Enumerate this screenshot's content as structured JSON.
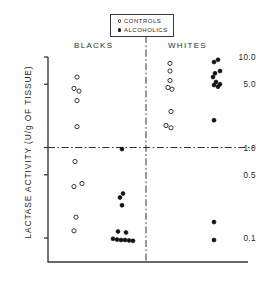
{
  "figure": {
    "kind": "scatter-dot-plot",
    "axis": {
      "x_left_px": 48,
      "x_right_px": 248,
      "y_top_px": 57,
      "y_bottom_px": 262
    },
    "colors": {
      "axis": "#3a3a3a",
      "marker_open_stroke": "#2b2b2b",
      "marker_filled": "#111111",
      "reference_line": "#333333",
      "text": "#1f1f1f",
      "background": "#ffffff"
    }
  },
  "legend": {
    "position": "top-center",
    "entries": [
      {
        "marker": "open-circle",
        "label": "CONTROLS"
      },
      {
        "marker": "filled-circle",
        "label": "ALCOHOLICS"
      }
    ]
  },
  "groups": {
    "left_label": "BLACKS",
    "right_label": "WHITES"
  },
  "chart_data": {
    "type": "scatter",
    "title": "",
    "subtitle": "",
    "xlabel": "",
    "ylabel": "LACTASE ACTIVITY (U/g OF TISSUE)",
    "yscale": "log",
    "ylim": [
      0.07,
      11.5
    ],
    "yticks": [
      10.0,
      5.0,
      1.0,
      0.5,
      0.1
    ],
    "ytick_labels": [
      "10.0",
      "5.0",
      "1.0",
      "0.5",
      "0.1"
    ],
    "grid": false,
    "legend_position": "top-center",
    "xcategories": [
      "BLACKS / CONTROLS",
      "BLACKS / ALCOHOLICS",
      "WHITES / CONTROLS",
      "WHITES / ALCOHOLICS"
    ],
    "annotations": [
      {
        "type": "hline",
        "y": 1.0,
        "style": "dash-dot",
        "label": "1.0 reference"
      },
      {
        "type": "vline",
        "x": "between BLACKS and WHITES",
        "style": "dash-dot",
        "label": "group divider"
      }
    ],
    "series": [
      {
        "name": "BLACKS / CONTROLS",
        "marker": "open-circle",
        "group": "BLACKS",
        "subject": "CONTROLS",
        "column_x_px": 77,
        "n": 9,
        "values": [
          6.0,
          4.5,
          4.2,
          3.3,
          1.7,
          0.7,
          0.4,
          0.37,
          0.17,
          0.12
        ],
        "points": [
          {
            "y": 6.0,
            "dx": 0
          },
          {
            "y": 4.5,
            "dx": -3
          },
          {
            "y": 4.2,
            "dx": 2
          },
          {
            "y": 3.3,
            "dx": 0
          },
          {
            "y": 1.7,
            "dx": 0
          },
          {
            "y": 0.7,
            "dx": -2
          },
          {
            "y": 0.4,
            "dx": 5
          },
          {
            "y": 0.37,
            "dx": -3
          },
          {
            "y": 0.17,
            "dx": -1
          },
          {
            "y": 0.12,
            "dx": -3
          }
        ]
      },
      {
        "name": "BLACKS / ALCOHOLICS",
        "marker": "filled-circle",
        "group": "BLACKS",
        "subject": "ALCOHOLICS",
        "column_x_px": 122,
        "n": 12,
        "values": [
          0.96,
          0.31,
          0.28,
          0.23,
          0.118,
          0.115,
          0.098,
          0.096,
          0.095,
          0.095,
          0.094,
          0.093
        ],
        "points": [
          {
            "y": 0.96,
            "dx": 0
          },
          {
            "y": 0.31,
            "dx": 1
          },
          {
            "y": 0.28,
            "dx": -2
          },
          {
            "y": 0.23,
            "dx": 0
          },
          {
            "y": 0.118,
            "dx": -4
          },
          {
            "y": 0.115,
            "dx": 4
          },
          {
            "y": 0.098,
            "dx": -9
          },
          {
            "y": 0.096,
            "dx": -5
          },
          {
            "y": 0.095,
            "dx": -1
          },
          {
            "y": 0.095,
            "dx": 3
          },
          {
            "y": 0.094,
            "dx": 7
          },
          {
            "y": 0.093,
            "dx": 11
          }
        ]
      },
      {
        "name": "WHITES / CONTROLS",
        "marker": "open-circle",
        "group": "WHITES",
        "subject": "CONTROLS",
        "column_x_px": 170,
        "n": 8,
        "values": [
          8.5,
          7.0,
          5.5,
          4.6,
          4.4,
          2.5,
          1.75,
          1.65
        ],
        "points": [
          {
            "y": 8.5,
            "dx": 0
          },
          {
            "y": 7.0,
            "dx": 0
          },
          {
            "y": 5.5,
            "dx": 0
          },
          {
            "y": 4.6,
            "dx": -2
          },
          {
            "y": 4.4,
            "dx": 2
          },
          {
            "y": 2.5,
            "dx": 1
          },
          {
            "y": 1.75,
            "dx": -4
          },
          {
            "y": 1.65,
            "dx": 1
          }
        ]
      },
      {
        "name": "WHITES / ALCOHOLICS",
        "marker": "filled-circle",
        "group": "WHITES",
        "subject": "ALCOHOLICS",
        "column_x_px": 216,
        "n": 12,
        "values": [
          9.3,
          8.8,
          7.0,
          6.6,
          6.0,
          5.3,
          5.0,
          4.9,
          4.7,
          2.0,
          0.15,
          0.095
        ],
        "points": [
          {
            "y": 9.3,
            "dx": 2
          },
          {
            "y": 8.8,
            "dx": -2
          },
          {
            "y": 7.0,
            "dx": 4
          },
          {
            "y": 6.6,
            "dx": -1
          },
          {
            "y": 6.0,
            "dx": -3
          },
          {
            "y": 5.3,
            "dx": 0
          },
          {
            "y": 5.0,
            "dx": 4
          },
          {
            "y": 4.9,
            "dx": -2
          },
          {
            "y": 4.7,
            "dx": 2
          },
          {
            "y": 2.0,
            "dx": -2
          },
          {
            "y": 0.15,
            "dx": -2
          },
          {
            "y": 0.095,
            "dx": -2
          }
        ]
      }
    ]
  }
}
